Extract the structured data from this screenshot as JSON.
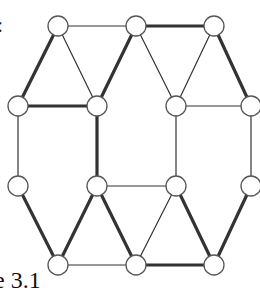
{
  "figure": {
    "caption_fragment": "e 3.1",
    "top_fragment": ":",
    "node_radius": 10,
    "colors": {
      "node_fill": "#ffffff",
      "node_stroke": "#555555",
      "edge": "#333333"
    },
    "edge_widths": {
      "thin": 1.2,
      "thick": 3.2
    },
    "nodes": [
      {
        "id": "A",
        "x": 58,
        "y": 26
      },
      {
        "id": "B",
        "x": 136,
        "y": 26
      },
      {
        "id": "C",
        "x": 214,
        "y": 26
      },
      {
        "id": "D",
        "x": 18,
        "y": 106
      },
      {
        "id": "E",
        "x": 97,
        "y": 106
      },
      {
        "id": "F",
        "x": 176,
        "y": 106
      },
      {
        "id": "G",
        "x": 251,
        "y": 106
      },
      {
        "id": "H",
        "x": 18,
        "y": 186
      },
      {
        "id": "I",
        "x": 97,
        "y": 186
      },
      {
        "id": "J",
        "x": 176,
        "y": 186
      },
      {
        "id": "K",
        "x": 251,
        "y": 186
      },
      {
        "id": "L",
        "x": 58,
        "y": 265
      },
      {
        "id": "M",
        "x": 136,
        "y": 265
      },
      {
        "id": "N",
        "x": 214,
        "y": 265
      }
    ],
    "edges": [
      {
        "from": "A",
        "to": "B",
        "weight": "thin"
      },
      {
        "from": "B",
        "to": "C",
        "weight": "thick"
      },
      {
        "from": "A",
        "to": "D",
        "weight": "thick"
      },
      {
        "from": "A",
        "to": "E",
        "weight": "thin"
      },
      {
        "from": "B",
        "to": "E",
        "weight": "thick"
      },
      {
        "from": "B",
        "to": "F",
        "weight": "thin"
      },
      {
        "from": "C",
        "to": "F",
        "weight": "thin"
      },
      {
        "from": "C",
        "to": "G",
        "weight": "thick"
      },
      {
        "from": "D",
        "to": "E",
        "weight": "thick"
      },
      {
        "from": "F",
        "to": "G",
        "weight": "thin"
      },
      {
        "from": "D",
        "to": "H",
        "weight": "thin"
      },
      {
        "from": "E",
        "to": "I",
        "weight": "thick"
      },
      {
        "from": "F",
        "to": "J",
        "weight": "thin"
      },
      {
        "from": "G",
        "to": "K",
        "weight": "thin"
      },
      {
        "from": "I",
        "to": "J",
        "weight": "thin"
      },
      {
        "from": "H",
        "to": "L",
        "weight": "thick"
      },
      {
        "from": "I",
        "to": "L",
        "weight": "thick"
      },
      {
        "from": "I",
        "to": "M",
        "weight": "thick"
      },
      {
        "from": "J",
        "to": "M",
        "weight": "thin"
      },
      {
        "from": "J",
        "to": "N",
        "weight": "thick"
      },
      {
        "from": "K",
        "to": "N",
        "weight": "thick"
      },
      {
        "from": "L",
        "to": "M",
        "weight": "thin"
      },
      {
        "from": "M",
        "to": "N",
        "weight": "thick"
      }
    ]
  }
}
